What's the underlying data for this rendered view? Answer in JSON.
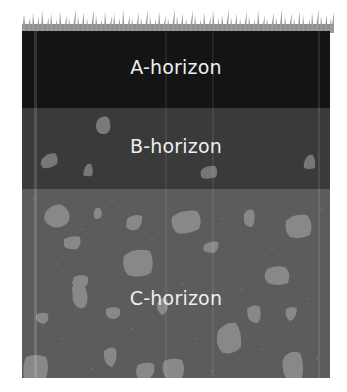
{
  "diagram": {
    "colors": {
      "grass": "#9a9a9a",
      "a_horizon": "#141414",
      "b_horizon": "#3a3a3a",
      "c_horizon": "#5c5c5c",
      "rock": "#8a8a8a",
      "label": "#eeeeee"
    },
    "layers": [
      {
        "id": "A",
        "label": "A-horizon"
      },
      {
        "id": "B",
        "label": "B-horizon"
      },
      {
        "id": "C",
        "label": "C-horizon"
      }
    ]
  }
}
